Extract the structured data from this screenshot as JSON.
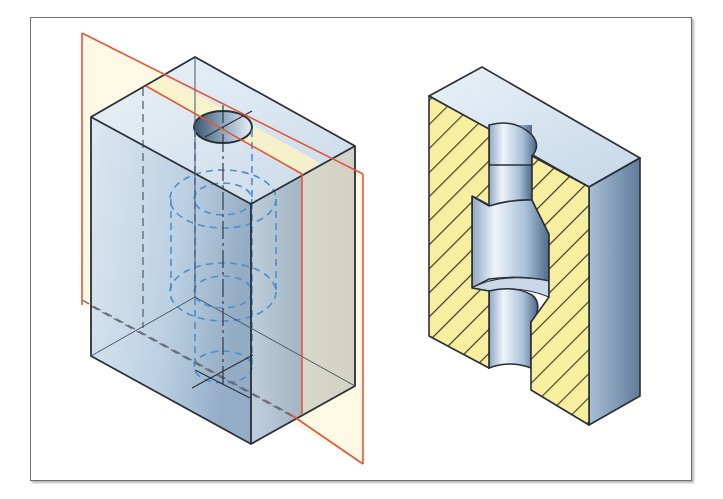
{
  "figure": {
    "left_view": {
      "label": "Transparent block with cutting plane",
      "cutting_plane_color": "#e0583a",
      "cutting_plane_fill": "#fdf6d8",
      "body_color": "#c7d9ea",
      "hidden_line_color": "#4a90d0",
      "edge_color": "#2b2f36"
    },
    "right_view": {
      "label": "Sectioned block showing counterbore",
      "section_fill": "#f7ee9f",
      "hatch_color": "#3b3320",
      "body_color": "#bdd1e4"
    }
  }
}
